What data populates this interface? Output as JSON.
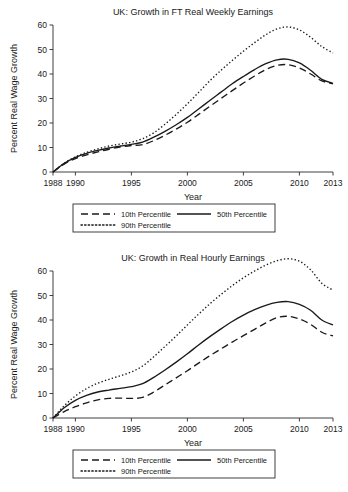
{
  "figure": {
    "caption_axis_label": "Year",
    "y_axis_label": "Percent Real Wage Growth"
  },
  "chart_data": [
    {
      "type": "line",
      "title": "UK: Growth in FT Real Weekly Earnings",
      "xlabel": "Year",
      "ylabel": "Percent Real Wage Growth",
      "xlim": [
        1988,
        2013
      ],
      "ylim": [
        0,
        60
      ],
      "xticks": [
        1988,
        1990,
        1995,
        2000,
        2005,
        2010,
        2013
      ],
      "xticklabels": [
        "1988",
        "1990",
        "1995",
        "2000",
        "2005",
        "2010",
        "2013"
      ],
      "yticks": [
        0,
        10,
        20,
        30,
        40,
        50,
        60
      ],
      "yticklabels": [
        "0",
        "10",
        "20",
        "30",
        "40",
        "50",
        "60"
      ],
      "grid": false,
      "legend_position": "below",
      "x": [
        1988,
        1989,
        1990,
        1991,
        1992,
        1993,
        1994,
        1995,
        1996,
        1997,
        1998,
        1999,
        2000,
        2001,
        2002,
        2003,
        2004,
        2005,
        2006,
        2007,
        2008,
        2009,
        2010,
        2011,
        2012,
        2013
      ],
      "series": [
        {
          "name": "10th Percentile",
          "dash": "dashed",
          "values": [
            0,
            3.2,
            5.5,
            7.0,
            8.2,
            9.3,
            10.2,
            10.8,
            11.2,
            12.8,
            15.0,
            17.5,
            20.3,
            23.5,
            26.8,
            30.0,
            33.2,
            36.3,
            39.2,
            41.8,
            43.5,
            43.8,
            42.5,
            40.0,
            37.2,
            36.0
          ]
        },
        {
          "name": "50th Percentile",
          "dash": "solid",
          "values": [
            0,
            3.5,
            6.0,
            7.6,
            8.8,
            9.8,
            10.6,
            11.3,
            12.2,
            14.2,
            16.6,
            19.3,
            22.3,
            25.7,
            29.2,
            32.6,
            36.0,
            39.0,
            41.8,
            44.2,
            45.8,
            46.0,
            44.5,
            41.5,
            37.8,
            36.2
          ]
        },
        {
          "name": "90th Percentile",
          "dash": "dotted",
          "values": [
            0,
            3.6,
            6.2,
            8.0,
            9.4,
            10.6,
            11.4,
            12.2,
            13.6,
            16.0,
            19.5,
            23.5,
            27.8,
            32.5,
            37.2,
            41.5,
            45.5,
            49.3,
            52.8,
            56.0,
            58.4,
            59.2,
            58.0,
            55.0,
            51.2,
            48.6
          ]
        }
      ]
    },
    {
      "type": "line",
      "title": "UK: Growth in Real Hourly Earnings",
      "xlabel": "Year",
      "ylabel": "Percent Real Wage Growth",
      "xlim": [
        1988,
        2013
      ],
      "ylim": [
        0,
        60
      ],
      "xticks": [
        1988,
        1990,
        1995,
        2000,
        2005,
        2010,
        2013
      ],
      "xticklabels": [
        "1988",
        "1990",
        "1995",
        "2000",
        "2005",
        "2010",
        "2013"
      ],
      "yticks": [
        0,
        10,
        20,
        30,
        40,
        50,
        60
      ],
      "yticklabels": [
        "0",
        "10",
        "20",
        "30",
        "40",
        "50",
        "60"
      ],
      "grid": false,
      "legend_position": "below",
      "x": [
        1988,
        1989,
        1990,
        1991,
        1992,
        1993,
        1994,
        1995,
        1996,
        1997,
        1998,
        1999,
        2000,
        2001,
        2002,
        2003,
        2004,
        2005,
        2006,
        2007,
        2008,
        2009,
        2010,
        2011,
        2012,
        2013
      ],
      "series": [
        {
          "name": "10th Percentile",
          "dash": "dashed",
          "values": [
            0,
            2.6,
            4.6,
            6.2,
            7.4,
            8.0,
            8.1,
            8.0,
            8.4,
            10.6,
            13.5,
            16.4,
            19.3,
            22.4,
            25.4,
            28.2,
            31.0,
            33.6,
            36.2,
            38.8,
            41.0,
            41.5,
            40.4,
            38.2,
            35.0,
            33.5
          ]
        },
        {
          "name": "50th Percentile",
          "dash": "solid",
          "values": [
            0,
            4.2,
            7.2,
            9.2,
            10.6,
            11.4,
            12.1,
            12.8,
            14.0,
            16.6,
            19.6,
            22.8,
            26.2,
            29.8,
            33.2,
            36.4,
            39.4,
            42.0,
            44.2,
            46.0,
            47.2,
            47.5,
            46.4,
            44.0,
            40.0,
            38.0
          ]
        },
        {
          "name": "90th Percentile",
          "dash": "dotted",
          "values": [
            0,
            5.0,
            9.0,
            12.0,
            14.2,
            15.8,
            17.2,
            18.8,
            21.2,
            25.0,
            29.2,
            33.5,
            38.0,
            42.4,
            46.6,
            50.4,
            54.0,
            57.2,
            60.0,
            62.4,
            64.2,
            65.0,
            64.0,
            60.5,
            55.0,
            52.2
          ]
        }
      ]
    }
  ]
}
